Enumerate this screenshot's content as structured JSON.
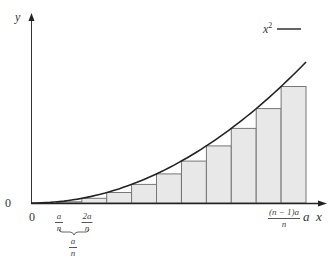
{
  "figure": {
    "type": "riemann-sum-diagram",
    "function_label": "x²",
    "legend": {
      "label_base": "x",
      "label_exp": "2",
      "line_color": "#222222"
    },
    "axes": {
      "x_label": "x",
      "y_label": "y",
      "origin_x_label": "0",
      "origin_y_label": "0",
      "end_label": "a"
    },
    "ticks": {
      "first": {
        "numerator": "a",
        "denominator": "n"
      },
      "second": {
        "numerator": "2a",
        "denominator": "n"
      },
      "last": {
        "numerator": "(n − 1)a",
        "denominator": "n"
      }
    },
    "brace_label": {
      "numerator": "a",
      "denominator": "n"
    },
    "rectangles": {
      "count": 11,
      "fill": "#e8e8e8",
      "stroke": "#777777",
      "method": "left-endpoint"
    },
    "colors": {
      "curve": "#222222",
      "axis": "#333333",
      "rect_fill": "#e8e8e8",
      "rect_stroke": "#777777"
    }
  },
  "chart_data": {
    "type": "area",
    "title": "",
    "function": "y = x^2",
    "n": 11,
    "x": [
      0,
      1,
      2,
      3,
      4,
      5,
      6,
      7,
      8,
      9,
      10,
      11
    ],
    "x_units": "a/n",
    "rect_heights_relative": [
      0,
      0.0083,
      0.0331,
      0.0744,
      0.1322,
      0.2066,
      0.2975,
      0.405,
      0.5289,
      0.6694,
      0.8264
    ],
    "xlabel": "x",
    "ylabel": "y",
    "tick_labels": [
      "0",
      "a/n",
      "2a/n",
      "(n − 1)a/n",
      "a"
    ],
    "legend": [
      "x²"
    ],
    "grid": false,
    "legend_position": "top-right"
  }
}
